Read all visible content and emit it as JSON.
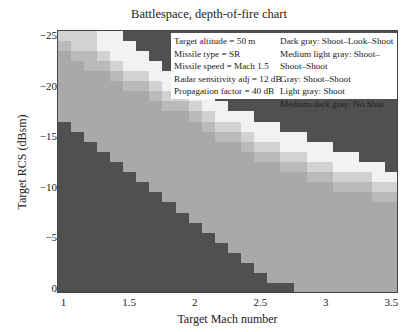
{
  "chart_data": {
    "type": "heatmap",
    "title": "Battlespace, depth-of-fire chart",
    "xlabel": "Target Mach number",
    "ylabel": "Target RCS (dBsm)",
    "xlim": [
      0.95,
      3.55
    ],
    "ylim": [
      0.5,
      -25.5
    ],
    "x_ticks": [
      "1",
      "1.5",
      "2",
      "2.5",
      "3",
      "3.5"
    ],
    "y_ticks": [
      "−25",
      "−20",
      "−15",
      "−10",
      "−5",
      "0"
    ],
    "x_values": [
      1.0,
      1.1,
      1.2,
      1.3,
      1.4,
      1.5,
      1.6,
      1.7,
      1.8,
      1.9,
      2.0,
      2.1,
      2.2,
      2.3,
      2.4,
      2.5,
      2.6,
      2.7,
      2.8,
      2.9,
      3.0,
      3.1,
      3.2,
      3.3,
      3.4,
      3.5
    ],
    "y_values": [
      -25,
      -24,
      -23,
      -22,
      -21,
      -20,
      -19,
      -18,
      -17,
      -16,
      -15,
      -14,
      -13,
      -12,
      -11,
      -10,
      -9,
      -8,
      -7,
      -6,
      -5,
      -4,
      -3,
      -2,
      -1,
      0
    ],
    "categories": {
      "0": {
        "label": "No Shot",
        "color": "#505050"
      },
      "1": {
        "label": "Shoot",
        "color": "#a9a9a9"
      },
      "2": {
        "label": "Shoot–Shoot",
        "color": "#bababa"
      },
      "3": {
        "label": "Shoot–Shoot–Shoot",
        "color": "#d2d2d2"
      },
      "4": {
        "label": "Shoot–Look–Shoot",
        "color": "#f2f2f2"
      }
    },
    "column_boundaries_note": "per column: RCS (dBsm) values bounding each category; cell is No Shot if RCS >= noshot_from, Shoot-Look-Shoot region above 'sls_to', etc.",
    "columns": [
      {
        "mach": 1.0,
        "noshot_from": -16,
        "shoot_to": -24,
        "ss_to": -25,
        "sss_to": -26,
        "sls_to": -26
      },
      {
        "mach": 1.1,
        "noshot_from": -15,
        "shoot_to": -23,
        "ss_to": -24,
        "sss_to": -26,
        "sls_to": -26
      },
      {
        "mach": 1.2,
        "noshot_from": -14,
        "shoot_to": -22,
        "ss_to": -24,
        "sss_to": -26,
        "sls_to": -26
      },
      {
        "mach": 1.3,
        "noshot_from": -13,
        "shoot_to": -22,
        "ss_to": -23,
        "sss_to": -24,
        "sls_to": -26
      },
      {
        "mach": 1.4,
        "noshot_from": -12,
        "shoot_to": -21,
        "ss_to": -22,
        "sss_to": -23,
        "sls_to": -26
      },
      {
        "mach": 1.5,
        "noshot_from": -11,
        "shoot_to": -20,
        "ss_to": -21,
        "sss_to": -22,
        "sls_to": -25
      },
      {
        "mach": 1.6,
        "noshot_from": -10,
        "shoot_to": -20,
        "ss_to": -21,
        "sss_to": -22,
        "sls_to": -24
      },
      {
        "mach": 1.7,
        "noshot_from": -9,
        "shoot_to": -19,
        "ss_to": -20,
        "sss_to": -21,
        "sls_to": -23
      },
      {
        "mach": 1.8,
        "noshot_from": -8,
        "shoot_to": -18,
        "ss_to": -19,
        "sss_to": -20,
        "sls_to": -22
      },
      {
        "mach": 1.9,
        "noshot_from": -7,
        "shoot_to": -18,
        "ss_to": -19,
        "sss_to": -20,
        "sls_to": -22
      },
      {
        "mach": 2.0,
        "noshot_from": -6,
        "shoot_to": -17,
        "ss_to": -18,
        "sss_to": -19,
        "sls_to": -21
      },
      {
        "mach": 2.1,
        "noshot_from": -5,
        "shoot_to": -16,
        "ss_to": -17,
        "sss_to": -18,
        "sls_to": -20
      },
      {
        "mach": 2.2,
        "noshot_from": -4,
        "shoot_to": -15,
        "ss_to": -16,
        "sss_to": -17,
        "sls_to": -19
      },
      {
        "mach": 2.3,
        "noshot_from": -3,
        "shoot_to": -15,
        "ss_to": -16,
        "sss_to": -17,
        "sls_to": -18
      },
      {
        "mach": 2.4,
        "noshot_from": -2,
        "shoot_to": -14,
        "ss_to": -15,
        "sss_to": -16,
        "sls_to": -18
      },
      {
        "mach": 2.5,
        "noshot_from": -1,
        "shoot_to": -13,
        "ss_to": -14,
        "sss_to": -15,
        "sls_to": -17
      },
      {
        "mach": 2.6,
        "noshot_from": 0,
        "shoot_to": -13,
        "ss_to": -14,
        "sss_to": -15,
        "sls_to": -17
      },
      {
        "mach": 2.7,
        "noshot_from": 0,
        "shoot_to": -12,
        "ss_to": -13,
        "sss_to": -14,
        "sls_to": -16
      },
      {
        "mach": 2.8,
        "noshot_from": 1,
        "shoot_to": -12,
        "ss_to": -13,
        "sss_to": -14,
        "sls_to": -16
      },
      {
        "mach": 2.9,
        "noshot_from": 1,
        "shoot_to": -11,
        "ss_to": -12,
        "sss_to": -13,
        "sls_to": -15
      },
      {
        "mach": 3.0,
        "noshot_from": 1,
        "shoot_to": -11,
        "ss_to": -12,
        "sss_to": -13,
        "sls_to": -15
      },
      {
        "mach": 3.1,
        "noshot_from": 1,
        "shoot_to": -10,
        "ss_to": -11,
        "sss_to": -12,
        "sls_to": -14
      },
      {
        "mach": 3.2,
        "noshot_from": 1,
        "shoot_to": -10,
        "ss_to": -11,
        "sss_to": -12,
        "sls_to": -14
      },
      {
        "mach": 3.3,
        "noshot_from": 1,
        "shoot_to": -10,
        "ss_to": -11,
        "sss_to": -12,
        "sls_to": -13
      },
      {
        "mach": 3.4,
        "noshot_from": 1,
        "shoot_to": -9,
        "ss_to": -10,
        "sss_to": -11,
        "sls_to": -13
      },
      {
        "mach": 3.5,
        "noshot_from": 1,
        "shoot_to": -9,
        "ss_to": -10,
        "sss_to": -11,
        "sls_to": -12
      }
    ],
    "legend": {
      "params": [
        "Target altitude = 50 m",
        "Missile type = SR",
        "Missile speed = Mach 1.5",
        "Radar sensitivity adj = 12 dB",
        "Propagation factor = 40 dB"
      ],
      "keys": [
        "Dark gray: Shoot–Look–Shoot",
        "Medium light gray: Shoot–Shoot–Shoot",
        "Gray: Shoot–Shoot",
        "Light gray: Shoot",
        "Medium dark gray: No Shot"
      ],
      "position": "upper right"
    },
    "grid": false
  }
}
